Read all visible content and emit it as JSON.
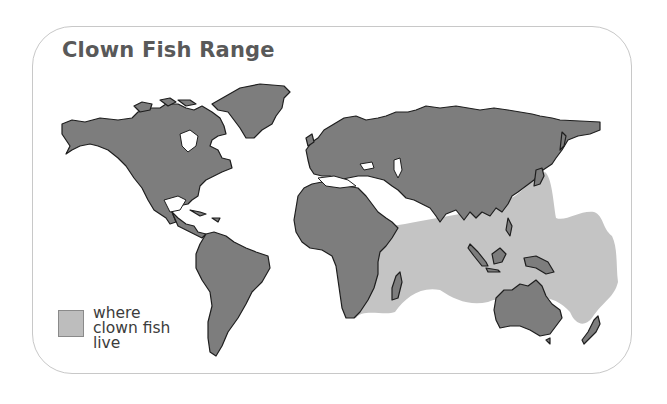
{
  "title": "Clown Fish Range",
  "legend": {
    "lines": [
      "where",
      "clown fish",
      "live"
    ],
    "swatch_color": "#bdbdbd"
  },
  "colors": {
    "land": "#7d7d7d",
    "land_outline": "#1e1e1e",
    "range": "#c4c4c4",
    "frame_border": "#c8c8c8",
    "title": "#595959"
  },
  "map": {
    "regions": [
      "North America",
      "Greenland",
      "South America",
      "Europe",
      "Asia",
      "Africa",
      "Australia",
      "New Zealand",
      "Madagascar",
      "Indonesia",
      "Japan",
      "New Guinea"
    ],
    "range_region": "Indian Ocean and Western Pacific"
  }
}
